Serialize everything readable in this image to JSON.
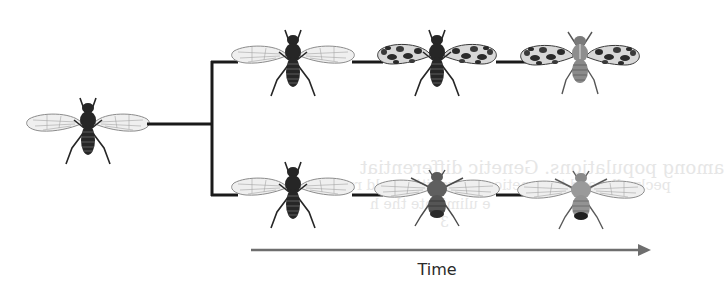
{
  "diagram": {
    "type": "phylogeny-divergence",
    "ancestor": {
      "label": "ancestral fly",
      "wing_pattern": "clear",
      "body_tone": "dark"
    },
    "branches": [
      {
        "name": "top-lineage",
        "stages": [
          {
            "wing_pattern": "clear",
            "body_tone": "dark"
          },
          {
            "wing_pattern": "spotted",
            "body_tone": "dark"
          },
          {
            "wing_pattern": "spotted",
            "body_tone": "pale-striped"
          }
        ]
      },
      {
        "name": "bottom-lineage",
        "stages": [
          {
            "wing_pattern": "clear",
            "body_tone": "dark"
          },
          {
            "wing_pattern": "clear",
            "body_tone": "medium-rounded"
          },
          {
            "wing_pattern": "clear",
            "body_tone": "light-rounded"
          }
        ]
      }
    ],
    "axis": {
      "label": "Time",
      "direction": "left-to-right"
    },
    "colors": {
      "connector": "#1a1a1a",
      "time_arrow": "#6e6e6e",
      "fly_dark": "#262626",
      "fly_medium": "#5a5a5a",
      "fly_light": "#8a8a8a",
      "wing_fill": "#eeeeee",
      "wing_stroke": "#8c8c8c",
      "bleed_text": "#e6e6e6"
    }
  },
  "bleed_through": {
    "line1": "among populations. Genetic differentiat",
    "line2": "peckyolks and to genetic apparquitive sold rs",
    "line3": "e  ulimidate the   h",
    "line4": "3"
  }
}
